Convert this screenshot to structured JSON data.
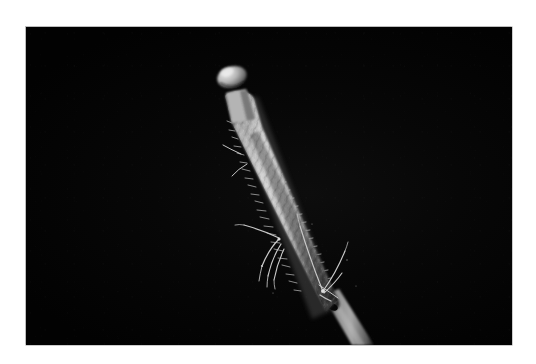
{
  "image": {
    "domain": "Natural-Image",
    "medium": "macro photograph",
    "orientation": "landscape",
    "canvas": {
      "width": 536,
      "height": 364
    },
    "background": {
      "name": "black-backdrop",
      "color": "#050505",
      "description": "uniform black studio background"
    },
    "border": {
      "name": "white-paper-margin",
      "color": "#ffffff",
      "edge_line_color": "#b4b4b4",
      "photo_rect": {
        "x": 26,
        "y": 27,
        "width": 486,
        "height": 318
      }
    }
  },
  "subject": {
    "name": "flowering-spike",
    "common_description": "pale fuzzy plant catkin or flower spike on a slender stem",
    "orientation_degrees": 22,
    "colors": {
      "body_mid": "#9a9a9a",
      "body_highlight": "#d8d8d8",
      "body_shadow": "#4a4a4a",
      "stem": "#8e8e8e",
      "bristle": "#cfcfcf"
    },
    "parts": [
      {
        "name": "bulb-cap",
        "label": "rounded bulbous tip",
        "position": {
          "x": 222,
          "y": 74
        },
        "size": {
          "width": 26,
          "height": 18
        }
      },
      {
        "name": "neck",
        "label": "narrow neck below the cap",
        "position": {
          "x": 228,
          "y": 92
        }
      },
      {
        "name": "spike-body",
        "label": "tapering fuzzy spike covered in short bristles",
        "from": {
          "x": 232,
          "y": 96
        },
        "to": {
          "x": 330,
          "y": 300
        }
      },
      {
        "name": "stem",
        "label": "smooth stem continuing past the spike to the frame edge",
        "from": {
          "x": 330,
          "y": 300
        },
        "to": {
          "x": 368,
          "y": 345
        }
      },
      {
        "name": "node-joint",
        "label": "dark joint / node where the stem meets the spike",
        "position": {
          "x": 332,
          "y": 302
        }
      }
    ]
  },
  "insect": {
    "name": "insect-on-stalk",
    "description": "slender long-legged insect clinging to the lower third of the spike",
    "color": "#c4c4c4",
    "limbs": [
      {
        "name": "left-foreleg",
        "from": {
          "x": 278,
          "y": 238
        },
        "to": {
          "x": 262,
          "y": 272
        }
      },
      {
        "name": "left-midleg",
        "from": {
          "x": 280,
          "y": 243
        },
        "to": {
          "x": 268,
          "y": 282
        }
      },
      {
        "name": "left-hindleg",
        "from": {
          "x": 283,
          "y": 248
        },
        "to": {
          "x": 274,
          "y": 286
        }
      },
      {
        "name": "left-antenna",
        "from": {
          "x": 279,
          "y": 237
        },
        "to": {
          "x": 244,
          "y": 224
        }
      },
      {
        "name": "right-upper-antenna",
        "from": {
          "x": 322,
          "y": 288
        },
        "to": {
          "x": 300,
          "y": 226
        }
      },
      {
        "name": "right-long-leg",
        "from": {
          "x": 323,
          "y": 290
        },
        "to": {
          "x": 345,
          "y": 250
        }
      },
      {
        "name": "right-lower-leg",
        "from": {
          "x": 324,
          "y": 292
        },
        "to": {
          "x": 341,
          "y": 272
        }
      }
    ]
  },
  "stray_hairs": [
    {
      "name": "hair-upper-left",
      "from": {
        "x": 240,
        "y": 152
      },
      "to": {
        "x": 226,
        "y": 146
      }
    },
    {
      "name": "hair-mid-left",
      "from": {
        "x": 248,
        "y": 160
      },
      "to": {
        "x": 238,
        "y": 168
      }
    },
    {
      "name": "hair-lower-right",
      "from": {
        "x": 318,
        "y": 284
      },
      "to": {
        "x": 336,
        "y": 296
      }
    }
  ]
}
